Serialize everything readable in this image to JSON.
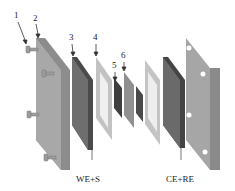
{
  "diagram": {
    "numbers": [
      {
        "id": "1",
        "x": 14,
        "y": 11
      },
      {
        "id": "2",
        "x": 33,
        "y": 14
      },
      {
        "id": "3",
        "x": 69,
        "y": 33
      },
      {
        "id": "4",
        "x": 93,
        "y": 33
      },
      {
        "id": "5",
        "x": 113,
        "y": 61
      },
      {
        "id": "6",
        "x": 122,
        "y": 51
      }
    ],
    "labels": {
      "we_s": "WE+S",
      "ce_re": "CE+RE"
    },
    "colors": {
      "plate_light": "#a9a9a9",
      "plate_mid": "#8a8a8a",
      "plate_dark": "#555555",
      "gasket": "#c4c4c4",
      "screw": "#9a9a9a"
    }
  }
}
